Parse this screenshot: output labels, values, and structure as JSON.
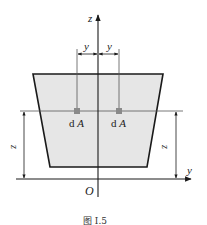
{
  "figure": {
    "caption": "图 Ⅰ.5",
    "axes": {
      "vertical_label": "z",
      "horizontal_label": "y",
      "origin_label": "O"
    },
    "dimensions": {
      "left_y_label": "y",
      "right_y_label": "y",
      "left_z_label": "z",
      "right_z_label": "z"
    },
    "elements": {
      "left_element_label": "dA",
      "right_element_label": "dA"
    },
    "colors": {
      "section_fill": "#e6e6e6",
      "outline": "#1a1a1a",
      "element_square": "#8a8a8a",
      "thin_line": "#555555"
    }
  }
}
